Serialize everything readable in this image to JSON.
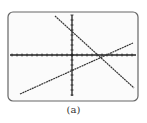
{
  "figure": {
    "caption": "(a)",
    "screen": {
      "frame": {
        "x": 8,
        "y": 12,
        "w": 130,
        "h": 89,
        "radius": 5,
        "stroke": "#666666",
        "fill": "#fbfbfb"
      },
      "axes": {
        "origin": {
          "x": 72,
          "y": 55
        },
        "x_axis": {
          "x1": 10,
          "x2": 136,
          "tick_spacing": 5
        },
        "y_axis": {
          "y1": 15,
          "y2": 96,
          "tick_spacing": 5
        },
        "color": "#222222"
      },
      "lines": [
        {
          "name": "decreasing-line",
          "x1": 55,
          "y1": 16,
          "x2": 134,
          "y2": 88,
          "color": "#333333"
        },
        {
          "name": "increasing-line",
          "x1": 20,
          "y1": 94,
          "x2": 133,
          "y2": 43,
          "color": "#333333"
        }
      ]
    }
  }
}
